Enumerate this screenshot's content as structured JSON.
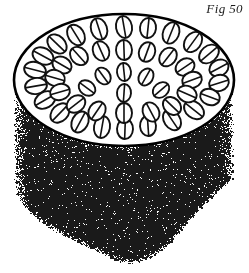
{
  "figure": {
    "label": "Fig 50",
    "caption_position": "top-right",
    "width": 249,
    "height": 273
  },
  "colors": {
    "ink": "#111111",
    "paper": "#ffffff",
    "stipple": "#1a1a1a",
    "outline": "#000000"
  },
  "chart_data": {
    "type": "diagram",
    "title": "Fig 50",
    "top_face": {
      "shape": "ellipse",
      "center_x": 124,
      "center_y": 80,
      "radius_x": 110,
      "radius_y": 66,
      "stroke_width": 2.6,
      "fill": "#ffffff"
    },
    "body": {
      "shape": "stippled-cylinder-wall",
      "top_y": 80,
      "bottom_y": 268,
      "left_x": 14,
      "right_x": 234,
      "texture": "random-speckle",
      "bottom_edge": "irregular-broken"
    },
    "bundles": {
      "count": 44,
      "shape": "ellipse-with-chord",
      "stroke_width": 1.9,
      "note": "each bundle is an outlined oval crossed by a single internal chord line; sizes and rotations vary",
      "items": [
        {
          "x": 124,
          "y": 27,
          "rx": 11,
          "ry": 8,
          "rot": 80
        },
        {
          "x": 99,
          "y": 29,
          "rx": 11,
          "ry": 8,
          "rot": 72
        },
        {
          "x": 148,
          "y": 28,
          "rx": 10,
          "ry": 8,
          "rot": 96
        },
        {
          "x": 171,
          "y": 33,
          "rx": 11,
          "ry": 8,
          "rot": 112
        },
        {
          "x": 76,
          "y": 35,
          "rx": 11,
          "ry": 8,
          "rot": 58
        },
        {
          "x": 193,
          "y": 42,
          "rx": 11,
          "ry": 8,
          "rot": 126
        },
        {
          "x": 57,
          "y": 44,
          "rx": 11,
          "ry": 8,
          "rot": 44
        },
        {
          "x": 209,
          "y": 54,
          "rx": 11,
          "ry": 8,
          "rot": 140
        },
        {
          "x": 43,
          "y": 56,
          "rx": 11,
          "ry": 8,
          "rot": 28
        },
        {
          "x": 219,
          "y": 68,
          "rx": 10,
          "ry": 8,
          "rot": 152
        },
        {
          "x": 35,
          "y": 70,
          "rx": 11,
          "ry": 8,
          "rot": 14
        },
        {
          "x": 219,
          "y": 83,
          "rx": 10,
          "ry": 8,
          "rot": 162
        },
        {
          "x": 36,
          "y": 86,
          "rx": 11,
          "ry": 8,
          "rot": 170
        },
        {
          "x": 210,
          "y": 97,
          "rx": 10,
          "ry": 8,
          "rot": 20
        },
        {
          "x": 45,
          "y": 100,
          "rx": 11,
          "ry": 8,
          "rot": 150
        },
        {
          "x": 194,
          "y": 110,
          "rx": 11,
          "ry": 8,
          "rot": 38
        },
        {
          "x": 60,
          "y": 113,
          "rx": 11,
          "ry": 8,
          "rot": 134
        },
        {
          "x": 172,
          "y": 120,
          "rx": 11,
          "ry": 8,
          "rot": 56
        },
        {
          "x": 80,
          "y": 122,
          "rx": 11,
          "ry": 8,
          "rot": 118
        },
        {
          "x": 148,
          "y": 126,
          "rx": 10,
          "ry": 8,
          "rot": 86
        },
        {
          "x": 102,
          "y": 127,
          "rx": 11,
          "ry": 8,
          "rot": 100
        },
        {
          "x": 125,
          "y": 129,
          "rx": 10,
          "ry": 8,
          "rot": 92
        },
        {
          "x": 124,
          "y": 50,
          "rx": 10,
          "ry": 8,
          "rot": 88
        },
        {
          "x": 101,
          "y": 51,
          "rx": 10,
          "ry": 8,
          "rot": 66
        },
        {
          "x": 147,
          "y": 52,
          "rx": 10,
          "ry": 8,
          "rot": 110
        },
        {
          "x": 79,
          "y": 56,
          "rx": 10,
          "ry": 8,
          "rot": 48
        },
        {
          "x": 168,
          "y": 57,
          "rx": 10,
          "ry": 8,
          "rot": 128
        },
        {
          "x": 62,
          "y": 65,
          "rx": 10,
          "ry": 8,
          "rot": 30
        },
        {
          "x": 185,
          "y": 67,
          "rx": 10,
          "ry": 8,
          "rot": 146
        },
        {
          "x": 55,
          "y": 78,
          "rx": 10,
          "ry": 8,
          "rot": 16
        },
        {
          "x": 192,
          "y": 80,
          "rx": 10,
          "ry": 8,
          "rot": 160
        },
        {
          "x": 60,
          "y": 92,
          "rx": 10,
          "ry": 8,
          "rot": 164
        },
        {
          "x": 187,
          "y": 94,
          "rx": 10,
          "ry": 8,
          "rot": 24
        },
        {
          "x": 76,
          "y": 104,
          "rx": 10,
          "ry": 8,
          "rot": 142
        },
        {
          "x": 172,
          "y": 106,
          "rx": 10,
          "ry": 8,
          "rot": 44
        },
        {
          "x": 97,
          "y": 111,
          "rx": 10,
          "ry": 8,
          "rot": 124
        },
        {
          "x": 151,
          "y": 112,
          "rx": 10,
          "ry": 8,
          "rot": 62
        },
        {
          "x": 124,
          "y": 113,
          "rx": 10,
          "ry": 8,
          "rot": 90
        },
        {
          "x": 124,
          "y": 72,
          "rx": 9,
          "ry": 7,
          "rot": 84
        },
        {
          "x": 103,
          "y": 76,
          "rx": 9,
          "ry": 7,
          "rot": 54
        },
        {
          "x": 146,
          "y": 77,
          "rx": 9,
          "ry": 7,
          "rot": 120
        },
        {
          "x": 87,
          "y": 88,
          "rx": 9,
          "ry": 7,
          "rot": 36
        },
        {
          "x": 161,
          "y": 90,
          "rx": 9,
          "ry": 7,
          "rot": 140
        },
        {
          "x": 124,
          "y": 93,
          "rx": 9,
          "ry": 7,
          "rot": 94
        }
      ]
    }
  }
}
